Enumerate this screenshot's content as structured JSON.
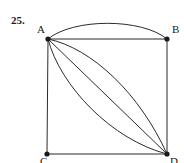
{
  "figure": {
    "problem_number": "25.",
    "caption": "",
    "background_color": "#ffffff",
    "stroke_color": "#2b2b2b",
    "vertex_color": "#1a1a1a",
    "label_color": "#1a1a1a"
  },
  "vertices": [
    {
      "id": "A",
      "label": "A",
      "x": 48,
      "y": 39
    },
    {
      "id": "B",
      "label": "B",
      "x": 167,
      "y": 39
    },
    {
      "id": "C",
      "label": "C",
      "x": 47,
      "y": 154
    },
    {
      "id": "D",
      "label": "D",
      "x": 167,
      "y": 154
    }
  ],
  "edges": [
    {
      "id": "edge-ab-straight",
      "from": "A",
      "to": "B",
      "kind": "straight"
    },
    {
      "id": "edge-ab-arc",
      "from": "A",
      "to": "B",
      "kind": "arc",
      "bulge": "up"
    },
    {
      "id": "edge-ac",
      "from": "A",
      "to": "C",
      "kind": "straight"
    },
    {
      "id": "edge-bd",
      "from": "B",
      "to": "D",
      "kind": "straight"
    },
    {
      "id": "edge-cd",
      "from": "C",
      "to": "D",
      "kind": "straight"
    },
    {
      "id": "edge-ad-straight",
      "from": "A",
      "to": "D",
      "kind": "straight"
    },
    {
      "id": "edge-ad-arc-upper",
      "from": "A",
      "to": "D",
      "kind": "arc",
      "bulge": "up-right"
    },
    {
      "id": "edge-ad-arc-lower",
      "from": "A",
      "to": "D",
      "kind": "arc",
      "bulge": "down-left"
    }
  ],
  "paths": {
    "ab_straight": "M 48 39 L 167 39",
    "ab_arc": "M 48 39 C 73 18, 142 18, 167 39",
    "ac": "M 48 39 L 47 154",
    "bd": "M 167 39 L 167 154",
    "cd": "M 47 154 L 167 154",
    "ad_straight": "M 48 39 L 167 154",
    "ad_arc_upper": "M 48 39 C 92 48, 140 94, 167 154",
    "ad_arc_lower": "M 48 39 C 60 86, 112 140, 167 154"
  },
  "geometry": {
    "vertex_radius": 2.6,
    "stroke_width": 1.0
  }
}
